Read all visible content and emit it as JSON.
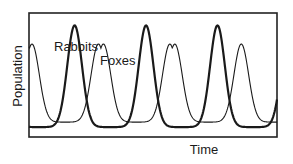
{
  "chart_data": {
    "type": "line",
    "title": "",
    "xlabel": "Time",
    "ylabel": "Population",
    "grid": false,
    "legend": "inline labels",
    "annotations": [
      {
        "text": "Rabbits",
        "series": "Rabbits"
      },
      {
        "text": "Foxes",
        "series": "Foxes"
      }
    ],
    "x": [
      0,
      1,
      2,
      3,
      4,
      5,
      6,
      7,
      8,
      9,
      10,
      11,
      12,
      13,
      14,
      15,
      16,
      17,
      18,
      19,
      20,
      21,
      22,
      23,
      24,
      25
    ],
    "series": [
      {
        "name": "Rabbits",
        "style": "thick",
        "peaks_x": [
          4.6,
          11.8,
          19.0
        ],
        "peak_value": 0.9,
        "min_value": 0.08,
        "period": 7.2,
        "note": "rising again at right edge"
      },
      {
        "name": "Foxes",
        "style": "thin",
        "peaks_x": [
          0.3,
          7.0,
          14.2,
          21.4
        ],
        "peak_value": 0.75,
        "min_value": 0.12,
        "period": 7.2,
        "note": "lags rabbits by ~quarter cycle"
      }
    ],
    "xlim": [
      0,
      25
    ],
    "ylim": [
      0,
      1
    ],
    "ticks": "none"
  },
  "labels": {
    "rabbits": "Rabbits",
    "foxes": "Foxes",
    "x_axis": "Time",
    "y_axis": "Population"
  },
  "colors": {
    "line": "#1a1a1a",
    "frame": "#222222",
    "background": "#ffffff"
  }
}
